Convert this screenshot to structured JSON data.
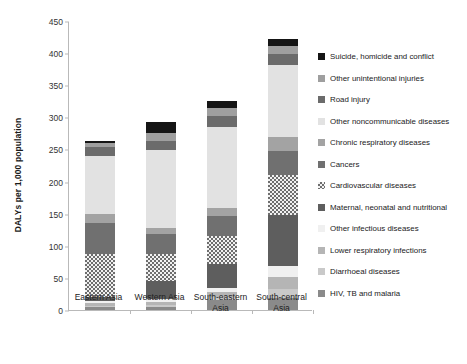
{
  "chart_data": {
    "type": "bar",
    "subtype": "stacked-vertical",
    "title": "",
    "xlabel": "",
    "ylabel": "DALYs per 1,000 population",
    "ylim": [
      0,
      450
    ],
    "ytick_step": 50,
    "yticks": [
      0,
      50,
      100,
      150,
      200,
      250,
      300,
      350,
      400,
      450
    ],
    "grid": false,
    "legend_position": "right",
    "categories": [
      "Eastern Asia",
      "Western Asia",
      "South-eastern Asia",
      "South-central Asia"
    ],
    "stack_order_bottom_to_top": [
      "HIV, TB and malaria",
      "Diarrhoeal diseases",
      "Lower respiratory infections",
      "Other infectious diseases",
      "Maternal, neonatal and nutritional",
      "Cardiovascular diseases",
      "Cancers",
      "Chronic respiratory diseases",
      "Other noncommunicable diseases",
      "Road injury",
      "Other unintentional injuries",
      "Suicide, homicide and conflict"
    ],
    "series": [
      {
        "name": "HIV, TB and malaria",
        "values": [
          5,
          5,
          16,
          18
        ],
        "color": "#8a8a8a",
        "pattern": "solid"
      },
      {
        "name": "Diarrhoeal diseases",
        "values": [
          2,
          3,
          4,
          14
        ],
        "color": "#c9c9c9",
        "pattern": "solid"
      },
      {
        "name": "Lower respiratory infections",
        "values": [
          4,
          5,
          8,
          20
        ],
        "color": "#b5b5b5",
        "pattern": "solid"
      },
      {
        "name": "Other infectious diseases",
        "values": [
          3,
          4,
          6,
          16
        ],
        "color": "#f0f0f0",
        "pattern": "solid"
      },
      {
        "name": "Maternal, neonatal and nutritional",
        "values": [
          6,
          28,
          38,
          80
        ],
        "color": "#5e5e5e",
        "pattern": "solid"
      },
      {
        "name": "Cardiovascular diseases",
        "values": [
          68,
          43,
          44,
          62
        ],
        "color": "#6e6e6e",
        "pattern": "checker"
      },
      {
        "name": "Cancers",
        "values": [
          48,
          30,
          30,
          37
        ],
        "color": "#707070",
        "pattern": "solid"
      },
      {
        "name": "Chronic respiratory diseases",
        "values": [
          14,
          10,
          13,
          23
        ],
        "color": "#a3a3a3",
        "pattern": "solid"
      },
      {
        "name": "Other noncommunicable diseases",
        "values": [
          90,
          122,
          126,
          111
        ],
        "color": "#e2e2e2",
        "pattern": "solid"
      },
      {
        "name": "Road injury",
        "values": [
          14,
          14,
          17,
          18
        ],
        "color": "#6b6b6b",
        "pattern": "solid"
      },
      {
        "name": "Other unintentional injuries",
        "values": [
          6,
          11,
          12,
          12
        ],
        "color": "#9f9f9f",
        "pattern": "solid"
      },
      {
        "name": "Suicide, homicide and conflict",
        "values": [
          4,
          18,
          11,
          11
        ],
        "color": "#151515",
        "pattern": "solid"
      }
    ],
    "totals": [
      264,
      293,
      325,
      422
    ]
  },
  "legend": {
    "items": [
      {
        "label": "Suicide, homicide and conflict",
        "color": "#151515",
        "pattern": "solid"
      },
      {
        "label": "Other unintentional injuries",
        "color": "#9f9f9f",
        "pattern": "solid"
      },
      {
        "label": "Road injury",
        "color": "#6b6b6b",
        "pattern": "solid"
      },
      {
        "label": "Other noncommunicable diseases",
        "color": "#e2e2e2",
        "pattern": "solid"
      },
      {
        "label": "Chronic respiratory diseases",
        "color": "#a3a3a3",
        "pattern": "solid"
      },
      {
        "label": "Cancers",
        "color": "#707070",
        "pattern": "solid"
      },
      {
        "label": "Cardiovascular diseases",
        "color": "#6e6e6e",
        "pattern": "checker"
      },
      {
        "label": "Maternal, neonatal and nutritional",
        "color": "#5e5e5e",
        "pattern": "solid"
      },
      {
        "label": "Other infectious diseases",
        "color": "#f0f0f0",
        "pattern": "solid"
      },
      {
        "label": "Lower respiratory infections",
        "color": "#b5b5b5",
        "pattern": "solid"
      },
      {
        "label": "Diarrhoeal diseases",
        "color": "#c9c9c9",
        "pattern": "solid"
      },
      {
        "label": "HIV, TB and malaria",
        "color": "#8a8a8a",
        "pattern": "solid"
      }
    ]
  },
  "axes": {
    "y_title": "DALYs per 1,000 population",
    "axis_color": "#b9b9b9"
  }
}
